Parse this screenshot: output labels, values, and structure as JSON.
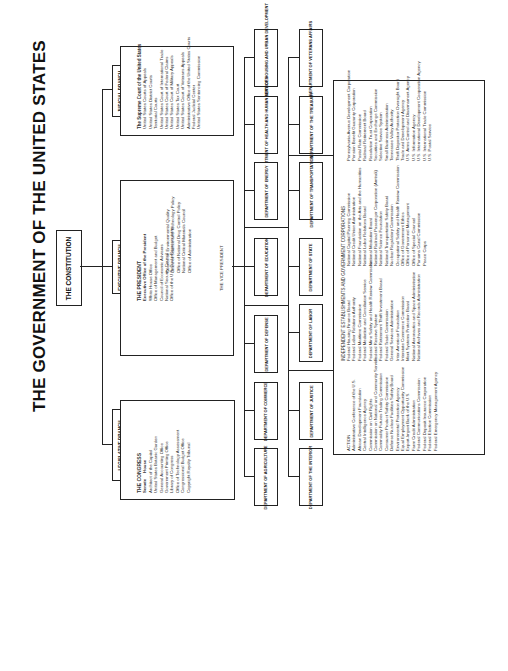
{
  "title": "THE GOVERNMENT OF THE UNITED STATES",
  "constitution": "THE CONSTITUTION",
  "branches": {
    "legislative": {
      "label": "LEGISLATIVE BRANCH",
      "heading": "THE CONGRESS",
      "sub": [
        "Senate",
        "House"
      ],
      "items": [
        "Architect of the Capitol",
        "United States Botanic Garden",
        "General Accounting Office",
        "Government Printing Office",
        "Library of Congress",
        "Office of Technology Assessment",
        "Congressional Budget Office",
        "Copyright Royalty Tribunal"
      ]
    },
    "executive": {
      "label": "EXECUTIVE BRANCH",
      "heading": "THE PRESIDENT",
      "subheading": "Executive Office of the President",
      "col1": [
        "White House Office",
        "Office of Management and Budget",
        "Council of Economic Advisers",
        "National Security Council",
        "Office of the U.S. Trade Representative"
      ],
      "col2": [
        "Council on Environmental Quality",
        "Office of Science and Technology Policy",
        "Office of National Drug Control Policy",
        "National Critical Materials Council",
        "Office of Administration"
      ],
      "vp": "THE VICE PRESIDENT"
    },
    "judicial": {
      "label": "JUDICIAL BRANCH",
      "heading": "The Supreme Court of the United States",
      "items": [
        "United States Courts of Appeals",
        "United States District Courts",
        "Territorial Courts",
        "United States Court of International Trade",
        "United States Court of Federal Claims",
        "United States Court of Military Appeals",
        "United States Tax Court",
        "United States Court of Veterans Appeals",
        "Administrative Office of the United States Courts",
        "Federal Judicial Center",
        "United States Sentencing Commission"
      ]
    }
  },
  "departments_row1": [
    "DEPARTMENT OF AGRICULTURE",
    "DEPARTMENT OF COMMERCE",
    "DEPARTMENT OF DEFENSE",
    "DEPARTMENT OF EDUCATION",
    "DEPARTMENT OF ENERGY",
    "DEPARTMENT OF HEALTH AND HUMAN SERVICES",
    "DEPARTMENT OF HOUSING AND URBAN DEVELOPMENT"
  ],
  "departments_row2": [
    "DEPARTMENT OF THE INTERIOR",
    "DEPARTMENT OF JUSTICE",
    "DEPARTMENT OF LABOR",
    "DEPARTMENT OF STATE",
    "DEPARTMENT OF TRANSPORTATION",
    "DEPARTMENT OF THE TREASURY",
    "DEPARTMENT OF VETERANS AFFAIRS"
  ],
  "independent": {
    "heading": "INDEPENDENT ESTABLISHMENTS AND GOVERNMENT CORPORATIONS",
    "col1": [
      "ACTION",
      "Administrative Conference of the U.S.",
      "African Development Foundation",
      "Central Intelligence Agency",
      "Commission on Civil Rights",
      "Commission on National and Community Service",
      "Commodity Futures Trading Commission",
      "Consumer Product Safety Commission",
      "Defense Nuclear Facilities Safety Board",
      "Environmental Protection Agency",
      "Equal Employment Opportunity Commission",
      "Export-Import Bank of the U.S.",
      "Farm Credit Administration",
      "Federal Communications Commission",
      "Federal Deposit Insurance Corporation",
      "Federal Election Commission",
      "Federal Emergency Management Agency"
    ],
    "col2": [
      "Federal Housing Finance Board",
      "Federal Labor Relations Authority",
      "Federal Maritime Commission",
      "Federal Mediation and Conciliation Service",
      "Federal Mine Safety and Health Review Commission",
      "Federal Reserve System",
      "Federal Retirement Thrift Investment Board",
      "Federal Trade Commission",
      "General Services Administration",
      "Inter-American Foundation",
      "Interstate Commerce Commission",
      "Merit Systems Protection Board",
      "National Aeronautics and Space Administration",
      "National Archives and Records Administration"
    ],
    "col3": [
      "National Capital Planning Commission",
      "National Credit Union Administration",
      "National Foundation on the Arts and the Humanities",
      "National Labor Relations Board",
      "National Mediation Board",
      "National Railroad Passenger Corporation (Amtrak)",
      "National Science Foundation",
      "National Transportation Safety Board",
      "Nuclear Regulatory Commission",
      "Occupational Safety and Health Review Commission",
      "Office of Government Ethics",
      "Office of Personnel Management",
      "Office of Special Counsel",
      "Panama Canal Commission",
      "Peace Corps"
    ],
    "col4": [
      "Pennsylvania Avenue Development Corporation",
      "Pension Benefit Guaranty Corporation",
      "Postal Rate Commission",
      "Railroad Retirement Board",
      "Resolution Trust Corporation",
      "Securities and Exchange Commission",
      "Selective Service System",
      "Small Business Administration",
      "Tennessee Valley Authority",
      "Thrift Depositor Protection Oversight Board",
      "Trade and Development Agency",
      "U.S. Arms Control and Disarmament Agency",
      "U.S. Information Agency",
      "U.S. International Development Cooperation Agency",
      "U.S. International Trade Commission",
      "U.S. Postal Service"
    ]
  }
}
